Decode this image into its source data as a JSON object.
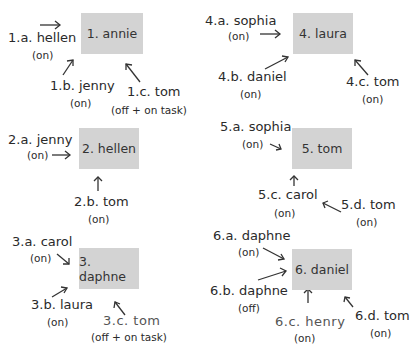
{
  "diagrams": [
    {
      "target": "1. annie",
      "sources": [
        {
          "label": "1.a. hellen",
          "status": "(on)"
        },
        {
          "label": "1.b. jenny",
          "status": "(on)"
        },
        {
          "label": "1.c. tom",
          "status": "(off + on task)"
        }
      ]
    },
    {
      "target": "2. hellen",
      "sources": [
        {
          "label": "2.a. jenny",
          "status": "(on)"
        },
        {
          "label": "2.b. tom",
          "status": "(on)"
        }
      ]
    },
    {
      "target": "3. daphne",
      "sources": [
        {
          "label": "3.a. carol",
          "status": "(on)"
        },
        {
          "label": "3.b. laura",
          "status": "(on)"
        },
        {
          "label": "3.c. tom",
          "status": "(off + on task)"
        }
      ]
    },
    {
      "target": "4. laura",
      "sources": [
        {
          "label": "4.a. sophia",
          "status": "(on)"
        },
        {
          "label": "4.b. daniel",
          "status": "(on)"
        },
        {
          "label": "4.c. tom",
          "status": "(on)"
        }
      ]
    },
    {
      "target": "5. tom",
      "sources": [
        {
          "label": "5.a. sophia",
          "status": "(on)"
        },
        {
          "label": "5.c. carol",
          "status": "(on)"
        },
        {
          "label": "5.d. tom",
          "status": "(on)"
        }
      ]
    },
    {
      "target": "6. daniel",
      "sources": [
        {
          "label": "6.a. daphne",
          "status": "(on)"
        },
        {
          "label": "6.b. daphne",
          "status": "(off)"
        },
        {
          "label": "6.c. henry",
          "status": "(on)"
        },
        {
          "label": "6.d. tom",
          "status": "(on)"
        }
      ]
    }
  ],
  "colors": {
    "box": "#d3d3d3",
    "text": "#2a2a2a",
    "arrow": "#333333"
  }
}
